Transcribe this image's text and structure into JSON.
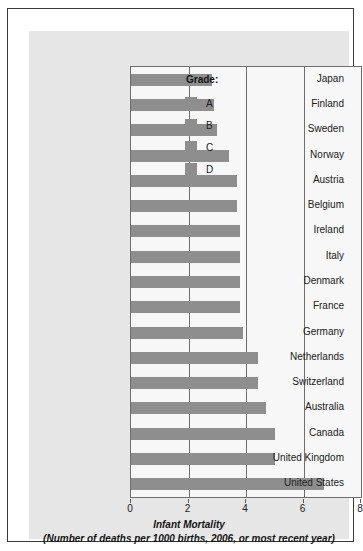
{
  "chart_data": {
    "type": "bar",
    "orientation": "horizontal",
    "title": "Infant Mortality",
    "subtitle": "(Number of deaths per 1000 births, 2006, or most recent year)",
    "xlabel": "",
    "ylabel": "",
    "xlim": [
      0,
      8
    ],
    "xticks": [
      0,
      2,
      4,
      6,
      8
    ],
    "xtick_labels": [
      "0",
      "2",
      "4",
      "6",
      "8"
    ],
    "grid": true,
    "grid_axis": "x",
    "bar_color": "#8e8e8e",
    "plot_background": "#f7f7f7",
    "panel_background": "#e6e6e6",
    "categories": [
      "Japan",
      "Finland",
      "Sweden",
      "Norway",
      "Austria",
      "Belgium",
      "Ireland",
      "Italy",
      "Denmark",
      "France",
      "Germany",
      "Netherlands",
      "Switzerland",
      "Australia",
      "Canada",
      "United Kingdom",
      "United States"
    ],
    "values": [
      2.8,
      2.9,
      3.0,
      3.4,
      3.7,
      3.7,
      3.8,
      3.8,
      3.8,
      3.8,
      3.9,
      4.4,
      4.4,
      4.7,
      5.0,
      5.0,
      6.7
    ],
    "legend": {
      "position": "inside-right",
      "title": "Grade:",
      "entries": [
        {
          "label": "A",
          "color": "#8e8e8e"
        },
        {
          "label": "B",
          "color": "#8e8e8e"
        },
        {
          "label": "C",
          "color": "#8e8e8e"
        },
        {
          "label": "D",
          "color": "#8e8e8e"
        }
      ]
    }
  }
}
